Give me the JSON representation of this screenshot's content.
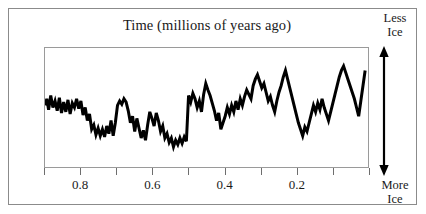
{
  "figure": {
    "title": "Time (millions of years ago)",
    "frame_color": "#8b8b8b",
    "plot_border_color": "#9a9a9a",
    "curve_color": "#000000",
    "background": "#ffffff"
  },
  "axis_y": {
    "top_label_line1": "Less",
    "top_label_line2": "Ice",
    "bottom_label_line1": "More",
    "bottom_label_line2": "Ice",
    "arrow": "double-headed-vertical-arrow"
  },
  "chart_data": {
    "type": "line",
    "title": "Time (millions of years ago)",
    "xlabel": "Time (millions of years ago)",
    "ylabel": "Ice volume",
    "y_axis_top_annotation": "Less Ice",
    "y_axis_bottom_annotation": "More Ice",
    "xlim": [
      0.9,
      0.0
    ],
    "ylim": [
      0,
      100
    ],
    "x_direction": "decreasing-left-to-right",
    "grid": false,
    "legend": null,
    "x_tick_labels": [
      "0.8",
      "0.6",
      "0.4",
      "0.2"
    ],
    "x_major_ticks": [
      0.8,
      0.6,
      0.4,
      0.2
    ],
    "x_minor_ticks": [
      0.9,
      0.7,
      0.5,
      0.3,
      0.1,
      0.0
    ],
    "series": [
      {
        "name": "Benthic oxygen isotope / ice volume proxy",
        "x": [
          0.9,
          0.895,
          0.89,
          0.884,
          0.878,
          0.872,
          0.866,
          0.86,
          0.854,
          0.848,
          0.842,
          0.836,
          0.83,
          0.824,
          0.818,
          0.812,
          0.806,
          0.8,
          0.794,
          0.788,
          0.782,
          0.776,
          0.77,
          0.764,
          0.758,
          0.752,
          0.746,
          0.74,
          0.734,
          0.728,
          0.722,
          0.716,
          0.71,
          0.704,
          0.698,
          0.692,
          0.686,
          0.68,
          0.674,
          0.668,
          0.662,
          0.656,
          0.65,
          0.644,
          0.638,
          0.632,
          0.626,
          0.62,
          0.614,
          0.608,
          0.602,
          0.596,
          0.59,
          0.584,
          0.578,
          0.572,
          0.566,
          0.56,
          0.554,
          0.548,
          0.542,
          0.536,
          0.53,
          0.524,
          0.518,
          0.512,
          0.506,
          0.5,
          0.494,
          0.488,
          0.482,
          0.476,
          0.47,
          0.464,
          0.458,
          0.452,
          0.446,
          0.44,
          0.434,
          0.428,
          0.422,
          0.416,
          0.41,
          0.404,
          0.398,
          0.392,
          0.386,
          0.38,
          0.374,
          0.368,
          0.362,
          0.356,
          0.35,
          0.344,
          0.338,
          0.332,
          0.326,
          0.32,
          0.314,
          0.308,
          0.302,
          0.296,
          0.29,
          0.284,
          0.278,
          0.272,
          0.266,
          0.26,
          0.254,
          0.248,
          0.242,
          0.236,
          0.23,
          0.224,
          0.218,
          0.212,
          0.206,
          0.2,
          0.194,
          0.188,
          0.182,
          0.176,
          0.17,
          0.164,
          0.158,
          0.152,
          0.146,
          0.14,
          0.134,
          0.128,
          0.122,
          0.116,
          0.11,
          0.104,
          0.098,
          0.092,
          0.086,
          0.08,
          0.074,
          0.068,
          0.062,
          0.056,
          0.05,
          0.044,
          0.038,
          0.032,
          0.026,
          0.02,
          0.014,
          0.008
        ],
        "values": [
          52,
          58,
          48,
          61,
          50,
          56,
          47,
          59,
          45,
          55,
          46,
          57,
          44,
          54,
          50,
          58,
          49,
          56,
          43,
          50,
          38,
          44,
          30,
          34,
          25,
          31,
          24,
          30,
          23,
          33,
          26,
          38,
          24,
          36,
          52,
          56,
          53,
          58,
          55,
          47,
          36,
          42,
          28,
          40,
          31,
          22,
          29,
          20,
          34,
          46,
          40,
          33,
          45,
          38,
          28,
          33,
          22,
          26,
          18,
          22,
          14,
          20,
          16,
          22,
          17,
          23,
          19,
          61,
          55,
          63,
          58,
          50,
          56,
          46,
          62,
          72,
          66,
          61,
          54,
          47,
          38,
          45,
          30,
          36,
          42,
          50,
          44,
          52,
          46,
          56,
          48,
          58,
          52,
          60,
          66,
          62,
          58,
          70,
          76,
          80,
          74,
          68,
          72,
          64,
          56,
          60,
          52,
          46,
          56,
          64,
          70,
          78,
          84,
          76,
          68,
          60,
          52,
          44,
          36,
          30,
          24,
          32,
          28,
          36,
          44,
          52,
          46,
          54,
          48,
          58,
          50,
          44,
          38,
          46,
          54,
          62,
          70,
          78,
          84,
          88,
          82,
          76,
          70,
          64,
          58,
          50,
          42,
          56,
          70,
          84
        ]
      }
    ]
  }
}
